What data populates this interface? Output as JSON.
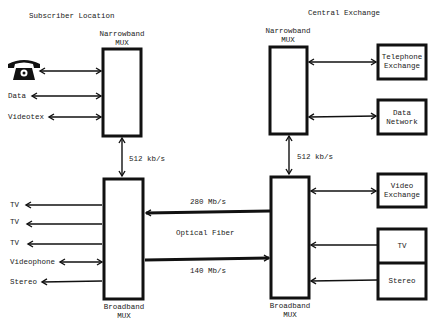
{
  "diagram": {
    "sections": {
      "subscriber": "Subscriber Location",
      "central": "Central Exchange"
    },
    "mux": {
      "sub_narrow": [
        "Narrowband",
        "MUX"
      ],
      "sub_broad": [
        "Broadband",
        "MUX"
      ],
      "ce_narrow": [
        "Narrowband",
        "MUX"
      ],
      "ce_broad": [
        "Broadband",
        "MUX"
      ]
    },
    "links": {
      "sub_512": "512 kb/s",
      "ce_512": "512 kb/s",
      "down": "280 Mb/s",
      "up": "140 Mb/s",
      "fiber": "Optical Fiber"
    },
    "subscriber_narrow_items": [
      "telephone-icon",
      "Data",
      "Videotex"
    ],
    "subscriber_broad_items": [
      "TV",
      "TV",
      "TV",
      "Videophone",
      "Stereo"
    ],
    "ce_boxes": {
      "telephone": [
        "Telephone",
        "Exchange"
      ],
      "data": [
        "Data",
        "Network"
      ],
      "video": [
        "Video",
        "Exchange"
      ],
      "tv": "TV",
      "stereo": "Stereo"
    }
  }
}
